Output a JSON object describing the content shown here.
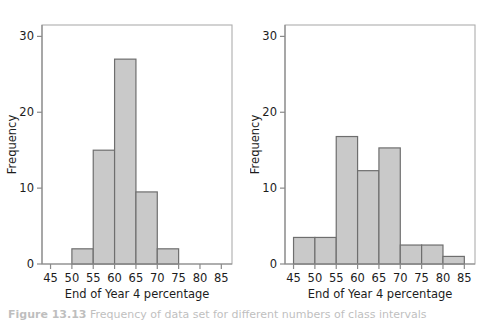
{
  "figure": {
    "caption_label": "Figure 13.13",
    "caption_rest": " Frequency of data set for different numbers of class intervals",
    "background_color": "#ffffff",
    "bar_fill_color": "#c9c9c9",
    "bar_stroke_color": "#6e6e6e",
    "axis_color": "#8a8a8a"
  },
  "chart_data": [
    {
      "type": "bar",
      "name": "left-histogram",
      "title": "",
      "xlabel": "End of Year 4 percentage",
      "ylabel": "Frequency",
      "xlim": [
        43,
        87.5
      ],
      "ylim": [
        0,
        31.5
      ],
      "xticks": [
        45,
        50,
        55,
        60,
        65,
        70,
        75,
        80,
        85
      ],
      "xtick_labels": [
        "45",
        "50",
        "55",
        "60",
        "65",
        "70",
        "75",
        "80",
        "85"
      ],
      "yticks": [
        0,
        10,
        20,
        30
      ],
      "ytick_labels": [
        "0",
        "10",
        "20",
        "30"
      ],
      "grid": false,
      "legend": "none",
      "bin_width": 5,
      "bins": [
        {
          "start": 50,
          "end": 55,
          "value": 2
        },
        {
          "start": 55,
          "end": 60,
          "value": 15
        },
        {
          "start": 60,
          "end": 65,
          "value": 27
        },
        {
          "start": 65,
          "end": 70,
          "value": 9.5
        },
        {
          "start": 70,
          "end": 75,
          "value": 2
        }
      ]
    },
    {
      "type": "bar",
      "name": "right-histogram",
      "title": "",
      "xlabel": "End of Year 4 percentage",
      "ylabel": "Frequency",
      "xlim": [
        43,
        87.5
      ],
      "ylim": [
        0,
        31.5
      ],
      "xticks": [
        45,
        50,
        55,
        60,
        65,
        70,
        75,
        80,
        85
      ],
      "xtick_labels": [
        "45",
        "50",
        "55",
        "60",
        "65",
        "70",
        "75",
        "80",
        "85"
      ],
      "yticks": [
        0,
        10,
        20,
        30
      ],
      "ytick_labels": [
        "0",
        "10",
        "20",
        "30"
      ],
      "grid": false,
      "legend": "none",
      "bin_width": 5,
      "bins": [
        {
          "start": 45,
          "end": 50,
          "value": 3.5
        },
        {
          "start": 50,
          "end": 55,
          "value": 3.5
        },
        {
          "start": 55,
          "end": 60,
          "value": 16.8
        },
        {
          "start": 60,
          "end": 65,
          "value": 12.3
        },
        {
          "start": 65,
          "end": 70,
          "value": 15.3
        },
        {
          "start": 70,
          "end": 75,
          "value": 2.5
        },
        {
          "start": 75,
          "end": 80,
          "value": 2.5
        },
        {
          "start": 80,
          "end": 85,
          "value": 1
        }
      ]
    }
  ]
}
